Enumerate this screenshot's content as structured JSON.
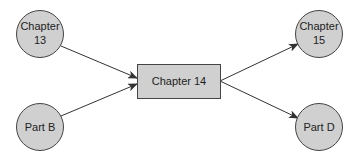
{
  "diagram": {
    "type": "flow",
    "colors": {
      "node_fill": "#d0d0d0",
      "node_stroke": "#444444",
      "edge": "#333333",
      "text": "#222222"
    },
    "nodes": {
      "chapter13": {
        "shape": "circle",
        "line1": "Chapter",
        "line2": "13"
      },
      "partB": {
        "shape": "circle",
        "label": "Part B"
      },
      "chapter14": {
        "shape": "rectangle",
        "label": "Chapter 14"
      },
      "chapter15": {
        "shape": "circle",
        "line1": "Chapter",
        "line2": "15"
      },
      "partD": {
        "shape": "circle",
        "label": "Part D"
      }
    },
    "edges": [
      {
        "from": "Chapter 13",
        "to": "Chapter 14"
      },
      {
        "from": "Part B",
        "to": "Chapter 14"
      },
      {
        "from": "Chapter 14",
        "to": "Chapter 15"
      },
      {
        "from": "Chapter 14",
        "to": "Part D"
      }
    ]
  }
}
